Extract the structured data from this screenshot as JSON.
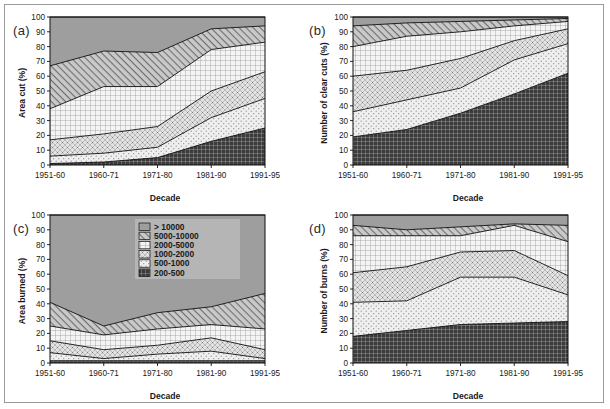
{
  "figure": {
    "background": "#ffffff",
    "frame_color": "#9a9a9a",
    "panel_tags": [
      "(a)",
      "(b)",
      "(c)",
      "(d)"
    ]
  },
  "legend": {
    "position": "inside-panel-c-top-right",
    "background": "#b5b5b5",
    "entries": [
      {
        "label": "> 10000",
        "pattern": "solid-gray",
        "color": "#9e9e9e"
      },
      {
        "label": "5000-10000",
        "pattern": "diagonal-hatch",
        "color": "#c8c8c8"
      },
      {
        "label": "2000-5000",
        "pattern": "grid-fine",
        "color": "#f0f0f0"
      },
      {
        "label": "1000-2000",
        "pattern": "cross-dot",
        "color": "#dcdcdc"
      },
      {
        "label": "500-1000",
        "pattern": "sparse-dot",
        "color": "#ececec"
      },
      {
        "label": "200-500",
        "pattern": "dark-grid",
        "color": "#3a3a3a"
      }
    ]
  },
  "chart_data": [
    {
      "type": "area",
      "panel": "(a)",
      "title": "",
      "xlabel": "Decade",
      "ylabel": "Area cut (%)",
      "categories": [
        "1951-60",
        "1960-71",
        "1971-80",
        "1981-90",
        "1991-95"
      ],
      "ylim": [
        0,
        100
      ],
      "yticks": [
        0,
        10,
        20,
        30,
        40,
        50,
        60,
        70,
        80,
        90,
        100
      ],
      "grid": false,
      "stacked": true,
      "series": [
        {
          "name": "200-500",
          "values": [
            1,
            2,
            5,
            16,
            25
          ]
        },
        {
          "name": "500-1000",
          "values": [
            6,
            8,
            12,
            32,
            45
          ]
        },
        {
          "name": "1000-2000",
          "values": [
            17,
            21,
            26,
            50,
            63
          ]
        },
        {
          "name": "2000-5000",
          "values": [
            38,
            53,
            53,
            78,
            83
          ]
        },
        {
          "name": "5000-10000",
          "values": [
            67,
            77,
            76,
            92,
            94
          ]
        },
        {
          "name": "> 10000",
          "values": [
            100,
            100,
            100,
            100,
            100
          ]
        }
      ],
      "cumulative": true
    },
    {
      "type": "area",
      "panel": "(b)",
      "title": "",
      "xlabel": "Decade",
      "ylabel": "Number of  clear cuts (%)",
      "categories": [
        "1951-60",
        "1960-71",
        "1971-80",
        "1981-90",
        "1991-95"
      ],
      "ylim": [
        0,
        100
      ],
      "yticks": [
        0,
        10,
        20,
        30,
        40,
        50,
        60,
        70,
        80,
        90,
        100
      ],
      "grid": false,
      "stacked": true,
      "series": [
        {
          "name": "200-500",
          "values": [
            19,
            24,
            35,
            48,
            62
          ]
        },
        {
          "name": "500-1000",
          "values": [
            36,
            44,
            52,
            71,
            82
          ]
        },
        {
          "name": "1000-2000",
          "values": [
            60,
            64,
            72,
            84,
            92
          ]
        },
        {
          "name": "2000-5000",
          "values": [
            80,
            87,
            90,
            94,
            97
          ]
        },
        {
          "name": "5000-10000",
          "values": [
            94,
            96,
            97,
            98,
            99
          ]
        },
        {
          "name": "> 10000",
          "values": [
            100,
            100,
            100,
            100,
            100
          ]
        }
      ],
      "cumulative": true
    },
    {
      "type": "area",
      "panel": "(c)",
      "title": "",
      "xlabel": "Decade",
      "ylabel": "Area burned (%)",
      "categories": [
        "1951-60",
        "1960-71",
        "1971-80",
        "1981-90",
        "1991-95"
      ],
      "ylim": [
        0,
        100
      ],
      "yticks": [
        0,
        10,
        20,
        30,
        40,
        50,
        60,
        70,
        80,
        90,
        100
      ],
      "grid": false,
      "stacked": true,
      "series": [
        {
          "name": "200-500",
          "values": [
            1.5,
            1.5,
            1.5,
            1.5,
            1.5
          ]
        },
        {
          "name": "500-1000",
          "values": [
            7,
            3,
            6,
            8,
            3
          ]
        },
        {
          "name": "1000-2000",
          "values": [
            15,
            9,
            12,
            17,
            9
          ]
        },
        {
          "name": "2000-5000",
          "values": [
            25,
            19,
            23,
            26,
            23
          ]
        },
        {
          "name": "5000-10000",
          "values": [
            41,
            25,
            34,
            38,
            47
          ]
        },
        {
          "name": "> 10000",
          "values": [
            100,
            100,
            100,
            100,
            100
          ]
        }
      ],
      "cumulative": true,
      "note_top_values": [
        56,
        25,
        35,
        39,
        47
      ]
    },
    {
      "type": "area",
      "panel": "(d)",
      "title": "",
      "xlabel": "Decade",
      "ylabel": "Number of  burns (%)",
      "categories": [
        "1951-60",
        "1960-71",
        "1971-80",
        "1981-90",
        "1991-95"
      ],
      "ylim": [
        0,
        100
      ],
      "yticks": [
        0,
        10,
        20,
        30,
        40,
        50,
        60,
        70,
        80,
        90,
        100
      ],
      "grid": false,
      "stacked": true,
      "series": [
        {
          "name": "200-500",
          "values": [
            18,
            22,
            26,
            27,
            28
          ]
        },
        {
          "name": "500-1000",
          "values": [
            41,
            42,
            58,
            58,
            46
          ]
        },
        {
          "name": "1000-2000",
          "values": [
            61,
            65,
            75,
            76,
            59
          ]
        },
        {
          "name": "2000-5000",
          "values": [
            86,
            86,
            86,
            93,
            82
          ]
        },
        {
          "name": "5000-10000",
          "values": [
            93,
            90,
            92,
            94,
            93
          ]
        },
        {
          "name": "> 10000",
          "values": [
            100,
            100,
            100,
            100,
            100
          ]
        }
      ],
      "cumulative": true
    }
  ]
}
